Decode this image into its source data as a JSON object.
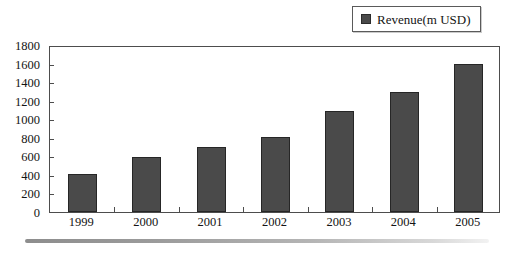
{
  "chart_data": {
    "type": "bar",
    "title": "",
    "subtitle": "",
    "xlabel": "",
    "ylabel": "",
    "categories": [
      "1999",
      "2000",
      "2001",
      "2002",
      "2003",
      "2004",
      "2005"
    ],
    "series": [
      {
        "name": "Revenue(m USD)",
        "color": "#4a4a4a",
        "values": [
          415,
          590,
          700,
          810,
          1090,
          1290,
          1595
        ]
      }
    ],
    "ylim": [
      0,
      1800
    ],
    "ytick_step": 200,
    "yticks": [
      0,
      200,
      400,
      600,
      800,
      1000,
      1200,
      1400,
      1600,
      1800
    ],
    "ytick_labels": [
      "0",
      "200",
      "400",
      "600",
      "800",
      "1000",
      "1200",
      "1400",
      "1600",
      "1800"
    ],
    "grid": false,
    "legend": {
      "position": "top-right",
      "entries": [
        {
          "label": "Revenue(m USD)",
          "swatch_color": "#4a4a4a"
        }
      ]
    }
  },
  "figure": {
    "background": "#ffffff",
    "frame_color": "#4d4d4d",
    "text_color": "#141414",
    "decoration": {
      "bottom_rule": true
    }
  }
}
